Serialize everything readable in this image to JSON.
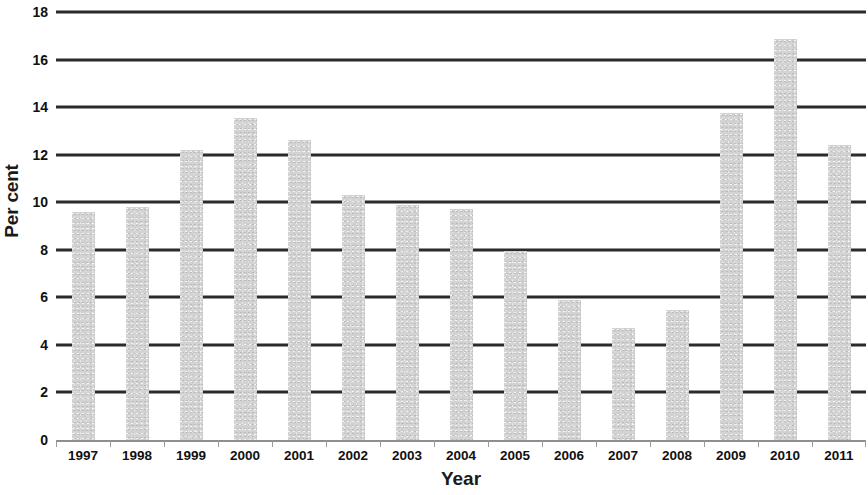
{
  "chart_data": {
    "type": "bar",
    "title": "",
    "xlabel": "Year",
    "ylabel": "Per cent",
    "categories": [
      "1997",
      "1998",
      "1999",
      "2000",
      "2001",
      "2002",
      "2003",
      "2004",
      "2005",
      "2006",
      "2007",
      "2008",
      "2009",
      "2010",
      "2011"
    ],
    "values": [
      9.6,
      9.8,
      12.2,
      13.55,
      12.6,
      10.3,
      9.9,
      9.7,
      7.95,
      5.9,
      4.7,
      5.45,
      13.75,
      16.85,
      12.4
    ],
    "ylim": [
      0,
      18
    ],
    "ytick_values": [
      0,
      2,
      4,
      6,
      8,
      10,
      12,
      14,
      16,
      18
    ],
    "ytick_labels": [
      "0",
      "2",
      "4",
      "6",
      "8",
      "10",
      "12",
      "14",
      "16",
      "18"
    ],
    "grid": true,
    "grid_axis": "y",
    "legend": false,
    "legend_position": "none",
    "bar_color": "#d3d3d3",
    "gridline_color": "#2b2b2b",
    "axis_text_color": "#111111"
  }
}
